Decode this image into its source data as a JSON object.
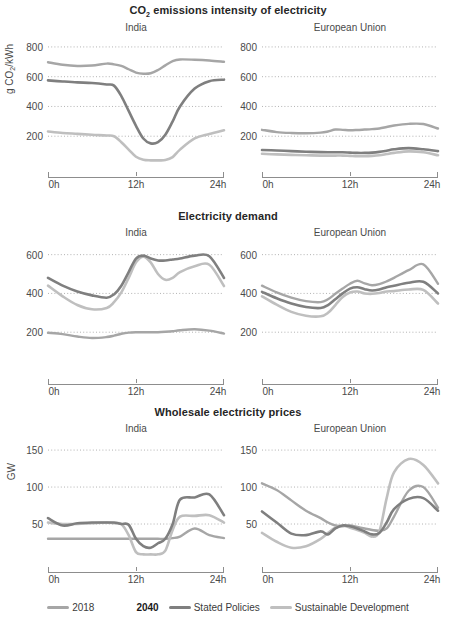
{
  "chart_data": [
    {
      "type": "line",
      "title": "CO2 emissions intensity of electricity",
      "ylabel": "g CO2/kWh",
      "xlabel": "",
      "ylim": [
        0,
        860
      ],
      "yticks": [
        800,
        600,
        400,
        200
      ],
      "xticks": [
        "0h",
        "12h",
        "24h"
      ],
      "x": [
        0,
        2,
        4,
        6,
        8,
        9,
        10,
        11,
        12,
        13,
        14,
        15,
        16,
        17,
        18,
        20,
        22,
        24
      ],
      "grid": true,
      "panels": [
        {
          "name": "India",
          "series": [
            {
              "name": "2018",
              "values": [
                697,
                680,
                672,
                675,
                688,
                683,
                672,
                650,
                628,
                620,
                623,
                645,
                676,
                705,
                716,
                714,
                709,
                700
              ]
            },
            {
              "name": "Stated Policies",
              "values": [
                575,
                568,
                562,
                558,
                548,
                540,
                470,
                370,
                270,
                185,
                152,
                160,
                210,
                300,
                400,
                520,
                570,
                580
              ]
            },
            {
              "name": "Sustainable Development",
              "values": [
                232,
                222,
                216,
                210,
                205,
                200,
                160,
                110,
                62,
                42,
                38,
                38,
                40,
                60,
                110,
                185,
                215,
                240
              ]
            }
          ]
        },
        {
          "name": "European Union",
          "series": [
            {
              "name": "2018",
              "values": [
                243,
                228,
                222,
                220,
                224,
                232,
                245,
                243,
                240,
                242,
                245,
                248,
                252,
                262,
                272,
                283,
                282,
                252
              ]
            },
            {
              "name": "Stated Policies",
              "values": [
                108,
                104,
                100,
                96,
                93,
                92,
                92,
                92,
                90,
                88,
                88,
                90,
                95,
                103,
                112,
                120,
                112,
                100
              ]
            },
            {
              "name": "Sustainable Development",
              "values": [
                82,
                78,
                75,
                72,
                70,
                70,
                70,
                70,
                68,
                66,
                66,
                68,
                72,
                80,
                88,
                98,
                92,
                72
              ]
            }
          ]
        }
      ]
    },
    {
      "type": "line",
      "title": "Electricity demand",
      "ylabel": "GW",
      "xlabel": "",
      "ylim": [
        0,
        660
      ],
      "yticks": [
        600,
        400,
        200
      ],
      "xticks": [
        "0h",
        "12h",
        "24h"
      ],
      "x": [
        0,
        2,
        4,
        6,
        8,
        9,
        10,
        11,
        12,
        13,
        14,
        15,
        16,
        17,
        18,
        20,
        22,
        24
      ],
      "grid": true,
      "panels": [
        {
          "name": "India",
          "series": [
            {
              "name": "2018",
              "values": [
                197,
                190,
                178,
                170,
                175,
                182,
                192,
                198,
                200,
                200,
                200,
                200,
                202,
                205,
                210,
                215,
                208,
                193
              ]
            },
            {
              "name": "Stated Policies",
              "values": [
                480,
                440,
                410,
                390,
                378,
                395,
                440,
                510,
                580,
                595,
                580,
                570,
                570,
                575,
                580,
                595,
                592,
                480
              ]
            },
            {
              "name": "Sustainable Development",
              "values": [
                440,
                385,
                340,
                318,
                325,
                355,
                405,
                480,
                560,
                590,
                560,
                500,
                470,
                480,
                510,
                540,
                548,
                438
              ]
            }
          ]
        },
        {
          "name": "European Union",
          "series": [
            {
              "name": "2018",
              "values": [
                440,
                405,
                378,
                360,
                355,
                370,
                398,
                425,
                450,
                465,
                452,
                442,
                448,
                462,
                480,
                520,
                550,
                450
              ]
            },
            {
              "name": "Stated Policies",
              "values": [
                408,
                375,
                348,
                330,
                325,
                340,
                370,
                400,
                425,
                432,
                422,
                415,
                420,
                432,
                440,
                455,
                460,
                400
              ]
            },
            {
              "name": "Sustainable Development",
              "values": [
                385,
                342,
                305,
                285,
                282,
                300,
                340,
                382,
                405,
                410,
                400,
                398,
                402,
                410,
                412,
                420,
                418,
                348
              ]
            }
          ]
        }
      ]
    },
    {
      "type": "line",
      "title": "Wholesale electricity prices",
      "ylabel": "Dollars per MWh (2018)",
      "xlabel": "",
      "ylim": [
        0,
        165
      ],
      "yticks": [
        150,
        100,
        50
      ],
      "xticks": [
        "0h",
        "12h",
        "24h"
      ],
      "x": [
        0,
        2,
        4,
        6,
        8,
        9,
        10,
        11,
        12,
        13,
        14,
        15,
        16,
        17,
        18,
        20,
        22,
        24
      ],
      "grid": true,
      "panels": [
        {
          "name": "India",
          "series": [
            {
              "name": "2018",
              "values": [
                30,
                30,
                30,
                30,
                30,
                30,
                30,
                30,
                30,
                30,
                30,
                30,
                30,
                31,
                33,
                44,
                35,
                31
              ]
            },
            {
              "name": "Stated Policies",
              "values": [
                58,
                48,
                51,
                52,
                52,
                52,
                50,
                49,
                30,
                20,
                18,
                24,
                30,
                50,
                83,
                86,
                90,
                62
              ]
            },
            {
              "name": "Sustainable Development",
              "values": [
                52,
                50,
                50,
                51,
                52,
                51,
                50,
                35,
                12,
                9,
                9,
                9,
                14,
                42,
                60,
                61,
                62,
                52
              ]
            }
          ]
        },
        {
          "name": "European Union",
          "series": [
            {
              "name": "2018",
              "values": [
                105,
                96,
                82,
                68,
                58,
                52,
                48,
                47,
                48,
                46,
                44,
                42,
                41,
                44,
                60,
                95,
                100,
                72
              ]
            },
            {
              "name": "Stated Policies",
              "values": [
                67,
                52,
                37,
                35,
                40,
                36,
                44,
                48,
                47,
                44,
                40,
                36,
                38,
                52,
                70,
                84,
                85,
                68
              ]
            },
            {
              "name": "Sustainable Development",
              "values": [
                38,
                26,
                18,
                20,
                30,
                38,
                45,
                48,
                45,
                42,
                38,
                33,
                40,
                85,
                120,
                138,
                130,
                105
              ]
            }
          ]
        }
      ]
    }
  ],
  "legend": {
    "items": [
      {
        "label": "2018",
        "color": "#a6a6a6"
      },
      {
        "group": "2040"
      },
      {
        "label": "Stated Policies",
        "color": "#7f7f7f"
      },
      {
        "label": "Sustainable Development",
        "color": "#bfbfbf"
      }
    ],
    "group_label": "2040"
  },
  "colors": {
    "series_2018": "#a6a6a6",
    "series_stated_policies": "#7f7f7f",
    "series_sustainable": "#bfbfbf",
    "axis": "#8d8d8d",
    "grid": "#9a9a9a",
    "text": "#4a4a4a",
    "title": "#262626"
  }
}
